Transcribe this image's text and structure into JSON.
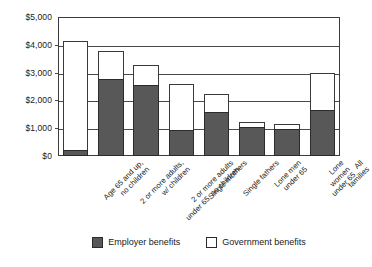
{
  "chart_data": {
    "type": "bar",
    "stacked": true,
    "title": "",
    "subtitle": "",
    "xlabel": "",
    "ylabel": "",
    "ylim": [
      0,
      5000
    ],
    "ytick_values": [
      0,
      1000,
      2000,
      3000,
      4000,
      5000
    ],
    "ytick_labels": [
      "$0",
      "$1,000",
      "$2,000",
      "$3,000",
      "$4,000",
      "$5,000"
    ],
    "grid": true,
    "legend_position": "bottom-center",
    "categories": [
      "Age 65 and up,\nno children",
      "2 or more adults,\nw/ children",
      "2 or more adults\nunder 65, no children",
      "Single mothers",
      "Single fathers",
      "Lone men\nunder 65",
      "Lone women\nunder 65",
      "All families"
    ],
    "series": [
      {
        "name": "Employer benefits",
        "color": "#585858",
        "values": [
          220,
          2780,
          2560,
          930,
          1580,
          1040,
          960,
          1650
        ]
      },
      {
        "name": "Government benefits",
        "color": "#ffffff",
        "values": [
          3910,
          990,
          710,
          1660,
          650,
          190,
          190,
          1340
        ]
      }
    ],
    "totals": [
      4130,
      3770,
      3270,
      2590,
      2230,
      1230,
      1150,
      2990
    ]
  },
  "legend": {
    "items": [
      {
        "label": "Employer benefits",
        "swatch": "employer-swatch"
      },
      {
        "label": "Government benefits",
        "swatch": "government-swatch"
      }
    ]
  },
  "colors": {
    "employer": "#585858",
    "government": "#ffffff",
    "axis": "#3c3c3c",
    "grid": "#4a4a4a",
    "text": "#1a1a1a",
    "background": "#ffffff"
  }
}
